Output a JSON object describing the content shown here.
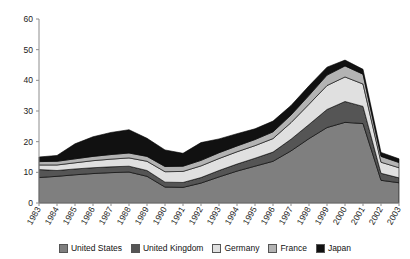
{
  "chart_data": {
    "type": "area",
    "stacked": true,
    "title": "",
    "subtitle": "",
    "xlabel": "",
    "ylabel": "",
    "grid": false,
    "legend_position": "bottom",
    "ylim": [
      0,
      60
    ],
    "yticks": [
      0,
      10,
      20,
      30,
      40,
      50,
      60
    ],
    "categories": [
      "1983",
      "1984",
      "1985",
      "1986",
      "1987",
      "1988",
      "1989",
      "1990",
      "1991",
      "1992",
      "1993",
      "1994",
      "1995",
      "1996",
      "1997",
      "1998",
      "1999",
      "2000",
      "2001",
      "2002",
      "2003"
    ],
    "series": [
      {
        "name": "United States",
        "color": "#7f7f7f",
        "values": [
          8.3,
          8.7,
          9.2,
          9.6,
          9.9,
          10.1,
          8.7,
          5.2,
          5.1,
          6.5,
          8.5,
          10.4,
          12.0,
          13.6,
          17.0,
          21.0,
          24.6,
          26.3,
          25.9,
          7.4,
          6.6
        ]
      },
      {
        "name": "United Kingdom",
        "color": "#555555",
        "values": [
          2.6,
          1.9,
          1.9,
          1.9,
          1.9,
          1.9,
          1.9,
          1.6,
          1.6,
          1.8,
          2.1,
          2.3,
          2.6,
          3.0,
          3.8,
          4.6,
          5.9,
          6.8,
          5.6,
          2.3,
          1.6
        ]
      },
      {
        "name": "Germany",
        "color": "#e0e0e0",
        "values": [
          1.5,
          1.8,
          2.0,
          2.3,
          2.5,
          2.7,
          3.0,
          3.4,
          3.6,
          3.8,
          3.9,
          4.0,
          4.1,
          4.4,
          5.4,
          6.6,
          7.8,
          8.0,
          7.3,
          3.6,
          3.3
        ]
      },
      {
        "name": "France",
        "color": "#b3b3b3",
        "values": [
          1.1,
          1.2,
          1.3,
          1.4,
          1.5,
          1.6,
          1.6,
          1.7,
          1.7,
          1.8,
          1.9,
          1.9,
          2.0,
          2.2,
          2.5,
          2.9,
          3.4,
          3.6,
          3.2,
          1.9,
          1.7
        ]
      },
      {
        "name": "Japan",
        "color": "#111111",
        "values": [
          1.5,
          1.9,
          4.9,
          6.4,
          7.2,
          7.6,
          5.9,
          5.4,
          4.2,
          5.8,
          4.5,
          4.0,
          3.5,
          3.5,
          3.1,
          3.1,
          2.6,
          1.9,
          1.6,
          1.3,
          1.2
        ]
      }
    ],
    "totals": [
      15.0,
      15.5,
      19.3,
      21.6,
      23.0,
      23.9,
      21.1,
      17.3,
      16.2,
      19.7,
      20.9,
      22.6,
      24.2,
      26.7,
      31.8,
      38.2,
      44.3,
      46.6,
      43.6,
      16.5,
      14.4
    ]
  },
  "legend": {
    "items": [
      {
        "label": "United States"
      },
      {
        "label": "United Kingdom"
      },
      {
        "label": "Germany"
      },
      {
        "label": "France"
      },
      {
        "label": "Japan"
      }
    ]
  },
  "axes": {
    "y_labels": [
      "60",
      "50",
      "40",
      "30",
      "20",
      "10",
      "0"
    ],
    "x_labels": [
      "1983",
      "1984",
      "1985",
      "1986",
      "1987",
      "1988",
      "1989",
      "1990",
      "1991",
      "1992",
      "1993",
      "1994",
      "1995",
      "1996",
      "1997",
      "1998",
      "1999",
      "2000",
      "2001",
      "2002",
      "2003"
    ]
  }
}
